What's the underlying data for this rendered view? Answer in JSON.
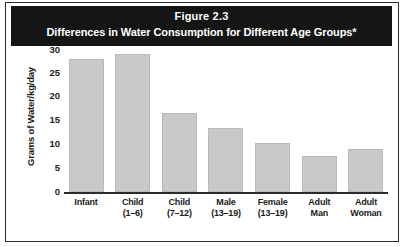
{
  "figure": {
    "title_line1": "Figure 2.3",
    "title_line2": "Differences in Water Consumption for Different Age Groups*"
  },
  "chart_data": {
    "type": "bar",
    "title": "Differences in Water Consumption for Different Age Groups*",
    "subtitle": "Figure 2.3",
    "xlabel": "",
    "ylabel": "Grams of Water/kg/day",
    "ylim": [
      0,
      30
    ],
    "yticks": [
      "30",
      "25",
      "20",
      "15",
      "10",
      "5",
      "0"
    ],
    "grid": false,
    "legend": "none",
    "categories": [
      "Infant",
      "Child (1–6)",
      "Child (7–12)",
      "Male (13–19)",
      "Female (13–19)",
      "Adult Man",
      "Adult Woman"
    ],
    "category_lines": [
      {
        "line1": "Infant",
        "line2": ""
      },
      {
        "line1": "Child",
        "line2": "(1–6)"
      },
      {
        "line1": "Child",
        "line2": "(7–12)"
      },
      {
        "line1": "Male",
        "line2": "(13–19)"
      },
      {
        "line1": "Female",
        "line2": "(13–19)"
      },
      {
        "line1": "Adult",
        "line2": "Man"
      },
      {
        "line1": "Adult",
        "line2": "Woman"
      }
    ],
    "values": [
      28,
      29,
      16.5,
      13.5,
      10.2,
      7.5,
      9
    ],
    "bar_color": "#c9c9c9",
    "bar_edge_color": "#b9b9b9"
  },
  "colors": {
    "title_bar_bg": "#151515",
    "title_text": "#ffffff",
    "axis": "#2b2b2b",
    "frame": "#2e2e2e"
  }
}
